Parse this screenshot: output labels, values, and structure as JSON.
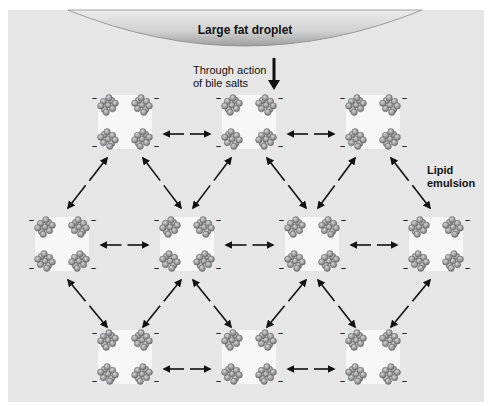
{
  "labels": {
    "droplet": "Large fat droplet",
    "action_line1": "Through action",
    "action_line2": "of bile salts",
    "emulsion_line1": "Lipid",
    "emulsion_line2": "emulsion"
  },
  "colors": {
    "panel": "#e6e6e6",
    "droplet_light": "#f2f2f2",
    "droplet_dark": "#9a9a9a",
    "micelle_core": "#f7f7f7",
    "bead": "#8c8c8c",
    "arrow": "#111111"
  },
  "micelles": {
    "rows": [
      {
        "name": "top-row",
        "count": 3
      },
      {
        "name": "middle-row",
        "count": 4
      },
      {
        "name": "bottom-row",
        "count": 3
      }
    ],
    "charge_symbol": "–"
  }
}
